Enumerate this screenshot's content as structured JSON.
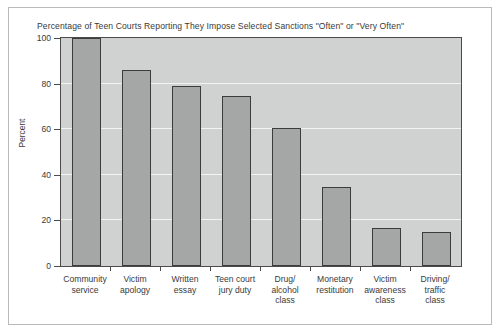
{
  "chart_data": {
    "type": "bar",
    "title": "Percentage of Teen Courts Reporting They Impose Selected Sanctions \"Often\" or \"Very Often\"",
    "xlabel": "",
    "ylabel": "Percent",
    "ylim": [
      0,
      100
    ],
    "yticks": [
      0,
      20,
      40,
      60,
      80,
      100
    ],
    "ytick_labels": [
      "0",
      "20",
      "40",
      "60",
      "80",
      "100"
    ],
    "grid": true,
    "legend": null,
    "categories": [
      "Community service",
      "Victim apology",
      "Written essay",
      "Teen court jury duty",
      "Drug/ alcohol class",
      "Monetary restitution",
      "Victim awareness class",
      "Driving/ traffic class"
    ],
    "category_lines": [
      [
        "Community",
        "service"
      ],
      [
        "Victim",
        "apology"
      ],
      [
        "Written",
        "essay"
      ],
      [
        "Teen court",
        "jury duty"
      ],
      [
        "Drug/",
        "alcohol",
        "class"
      ],
      [
        "Monetary",
        "restitution"
      ],
      [
        "Victim",
        "awareness",
        "class"
      ],
      [
        "Driving/",
        "traffic",
        "class"
      ]
    ],
    "values": [
      100,
      86,
      79,
      74.5,
      60.5,
      34.5,
      16.5,
      15
    ],
    "colors": {
      "bar_fill": "#a5a7a6",
      "bar_edge": "#3c3c3c",
      "plot_background": "#cfd2d0",
      "gridline": "#f2f4f3",
      "text": "#3a3a3a",
      "frame": "#b9b9b9"
    }
  }
}
